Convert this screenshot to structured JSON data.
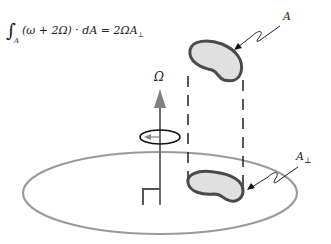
{
  "equation": {
    "integral_sign": "∫",
    "subscript": "A",
    "body": "(ω + 2Ω) · dA = 2ΩA",
    "perp_subscript": "⊥"
  },
  "labels": {
    "omega_axis": "Ω",
    "area": "A",
    "projected_area": "A",
    "projected_area_sub": "⊥"
  },
  "colors": {
    "ellipse_stroke": "#999999",
    "blob_fill": "#e0e0e0",
    "blob_stroke": "#4a4a4a",
    "axis_arrow": "#808080",
    "lines": "#222222"
  }
}
